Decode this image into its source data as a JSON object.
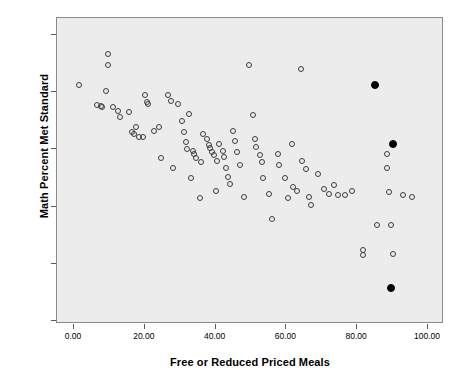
{
  "chart_data": {
    "type": "scatter",
    "title": "",
    "xlabel": "Free or Reduced Priced Meals",
    "ylabel": "Math Percent Met Standard",
    "xlim": [
      -7,
      106
    ],
    "ylim": [
      -7,
      106
    ],
    "xticks": [
      "0.00",
      "20.00",
      "40.00",
      "60.00",
      "80.00",
      "100.00"
    ],
    "xtick_values": [
      0,
      20,
      40,
      60,
      80,
      100
    ],
    "yticks": [
      "0.00",
      "20.00",
      "40.00",
      "60.00",
      "80.00",
      "100.00"
    ],
    "ytick_values": [
      0,
      20,
      40,
      60,
      80,
      100
    ],
    "grid": false,
    "legend": "none",
    "plot_background": "#ececec",
    "marker_open_color": "#3d3d3d",
    "marker_filled_color": "#000000",
    "series": [
      {
        "name": "schools",
        "marker": "open-circle",
        "points": [
          [
            1.5,
            82.5
          ],
          [
            6.5,
            75.5
          ],
          [
            7.5,
            75.2
          ],
          [
            8.0,
            75.0
          ],
          [
            9.5,
            93.5
          ],
          [
            9.5,
            89.5
          ],
          [
            9.0,
            80.5
          ],
          [
            11.0,
            75.0
          ],
          [
            12.5,
            73.5
          ],
          [
            13.0,
            71.5
          ],
          [
            15.5,
            73.0
          ],
          [
            16.5,
            66.0
          ],
          [
            17.0,
            65.5
          ],
          [
            17.5,
            68.0
          ],
          [
            18.5,
            64.5
          ],
          [
            19.5,
            64.5
          ],
          [
            20.5,
            76.5
          ],
          [
            21.0,
            76.0
          ],
          [
            20.0,
            79.0
          ],
          [
            22.5,
            66.5
          ],
          [
            24.0,
            68.0
          ],
          [
            24.5,
            57.0
          ],
          [
            26.5,
            79.0
          ],
          [
            27.5,
            77.0
          ],
          [
            28.0,
            53.5
          ],
          [
            29.5,
            76.0
          ],
          [
            30.5,
            70.0
          ],
          [
            31.0,
            66.0
          ],
          [
            31.5,
            62.5
          ],
          [
            32.0,
            60.0
          ],
          [
            32.5,
            72.5
          ],
          [
            33.5,
            59.5
          ],
          [
            34.0,
            58.5
          ],
          [
            34.5,
            57.0
          ],
          [
            35.5,
            43.0
          ],
          [
            36.0,
            55.5
          ],
          [
            33.0,
            50.0
          ],
          [
            36.5,
            65.5
          ],
          [
            37.5,
            63.5
          ],
          [
            38.0,
            61.5
          ],
          [
            38.5,
            60.5
          ],
          [
            39.0,
            59.0
          ],
          [
            39.5,
            58.0
          ],
          [
            40.5,
            56.0
          ],
          [
            41.0,
            62.0
          ],
          [
            42.0,
            59.5
          ],
          [
            42.5,
            57.5
          ],
          [
            43.0,
            53.5
          ],
          [
            43.5,
            50.5
          ],
          [
            44.0,
            48.0
          ],
          [
            40.0,
            45.5
          ],
          [
            45.0,
            66.5
          ],
          [
            45.5,
            63.0
          ],
          [
            46.0,
            59.0
          ],
          [
            47.0,
            54.5
          ],
          [
            48.0,
            43.5
          ],
          [
            49.5,
            89.5
          ],
          [
            50.5,
            72.0
          ],
          [
            51.0,
            63.5
          ],
          [
            51.5,
            61.0
          ],
          [
            52.5,
            58.0
          ],
          [
            53.0,
            55.5
          ],
          [
            53.5,
            50.0
          ],
          [
            55.0,
            44.5
          ],
          [
            56.0,
            35.5
          ],
          [
            57.5,
            58.5
          ],
          [
            58.0,
            54.5
          ],
          [
            59.5,
            50.0
          ],
          [
            60.5,
            43.0
          ],
          [
            61.5,
            62.0
          ],
          [
            62.0,
            47.0
          ],
          [
            63.0,
            45.5
          ],
          [
            64.0,
            88.0
          ],
          [
            64.5,
            56.0
          ],
          [
            65.5,
            53.0
          ],
          [
            66.5,
            43.5
          ],
          [
            67.0,
            40.5
          ],
          [
            69.0,
            51.5
          ],
          [
            70.5,
            46.0
          ],
          [
            72.0,
            44.5
          ],
          [
            73.5,
            47.5
          ],
          [
            74.5,
            44.0
          ],
          [
            76.5,
            44.0
          ],
          [
            78.5,
            45.5
          ],
          [
            81.5,
            25.0
          ],
          [
            81.5,
            23.0
          ],
          [
            85.5,
            33.5
          ],
          [
            88.5,
            58.5
          ],
          [
            88.5,
            53.5
          ],
          [
            89.0,
            45.0
          ],
          [
            89.5,
            33.5
          ],
          [
            90.0,
            23.5
          ],
          [
            93.0,
            44.0
          ],
          [
            95.5,
            43.5
          ]
        ]
      },
      {
        "name": "highlighted-schools",
        "marker": "filled-circle",
        "points": [
          [
            85.0,
            82.5
          ],
          [
            90.0,
            62.0
          ],
          [
            89.5,
            11.5
          ]
        ]
      }
    ]
  }
}
